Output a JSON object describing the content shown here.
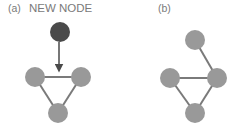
{
  "panels": [
    {
      "id": "a",
      "label": "(a)",
      "annotation": "NEW NODE",
      "new_node": {
        "cx": 60,
        "cy": 32,
        "r": 10,
        "color": "#4a4a4a"
      },
      "arrow": {
        "x1": 59,
        "y1": 42,
        "x2": 59,
        "y2": 68
      },
      "nodes": [
        {
          "cx": 35,
          "cy": 77,
          "r": 10
        },
        {
          "cx": 81,
          "cy": 77,
          "r": 10
        },
        {
          "cx": 58,
          "cy": 113,
          "r": 10
        }
      ],
      "edges": [
        [
          0,
          1
        ],
        [
          0,
          2
        ],
        [
          1,
          2
        ]
      ]
    },
    {
      "id": "b",
      "label": "(b)",
      "nodes": [
        {
          "cx": 195,
          "cy": 40,
          "r": 10
        },
        {
          "cx": 170,
          "cy": 78,
          "r": 10
        },
        {
          "cx": 217,
          "cy": 78,
          "r": 10
        },
        {
          "cx": 195,
          "cy": 113,
          "r": 10
        }
      ],
      "edges": [
        [
          0,
          2
        ],
        [
          1,
          2
        ],
        [
          1,
          3
        ],
        [
          2,
          3
        ]
      ]
    }
  ],
  "colors": {
    "node": "#999999",
    "edge": "#7a7a7a",
    "new_node": "#4a4a4a",
    "arrow": "#4a4a4a",
    "text": "#7a7a7a"
  }
}
